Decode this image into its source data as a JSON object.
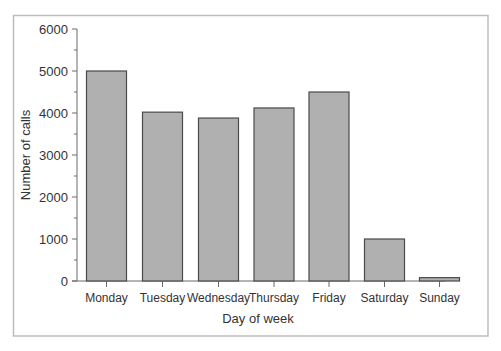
{
  "chart_data": {
    "type": "bar",
    "title": "",
    "xlabel": "Day of week",
    "ylabel": "Number of calls",
    "categories": [
      "Monday",
      "Tuesday",
      "Wednesday",
      "Thursday",
      "Friday",
      "Saturday",
      "Sunday"
    ],
    "values": [
      5000,
      4020,
      3880,
      4120,
      4500,
      1000,
      80
    ],
    "ylim": [
      0,
      6000
    ],
    "yticks": [
      0,
      1000,
      2000,
      3000,
      4000,
      5000,
      6000
    ],
    "minor_ytick_step": 500,
    "grid": false,
    "legend": null,
    "colors": {
      "bar_fill": "#b0b0b0",
      "bar_stroke": "#4a4a4a",
      "axis": "#6a6a6a",
      "frame": "#bdbdbd",
      "text": "#333333"
    }
  }
}
